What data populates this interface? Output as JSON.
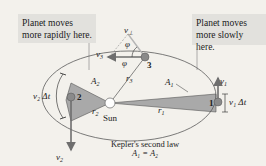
{
  "notes": {
    "left": "Planet moves more rapidly here.",
    "right": "Planet moves more slowly here."
  },
  "labels": {
    "sun": "Sun",
    "planet_1": "1",
    "planet_2": "2",
    "planet_3": "3",
    "area_1": "A",
    "area_1_sub": "1",
    "area_2": "A",
    "area_2_sub": "2",
    "r1": "r",
    "r1_sub": "1",
    "r2": "r",
    "r2_sub": "2",
    "r3": "r",
    "r3_sub": "3",
    "v1": "v",
    "v1_sub": "1",
    "v2": "v",
    "v2_sub": "2",
    "v3": "v",
    "v3_sub": "3",
    "v_perp": "v",
    "v_perp_sub": "⊥",
    "phi": "φ",
    "v1_dt": "v₁ Δt",
    "v2_dt": "v₂ Δt"
  },
  "caption": {
    "line1": "Kepler's second law",
    "line2": "A₁ = A₂"
  },
  "colors": {
    "background": "#f3f1ec",
    "note_box": "#e2e1dd",
    "area_fill": "#a9a9a9",
    "planet": "#8a8a8a",
    "vector": "#6e6e6e",
    "orbit": "#5a5a5a"
  }
}
